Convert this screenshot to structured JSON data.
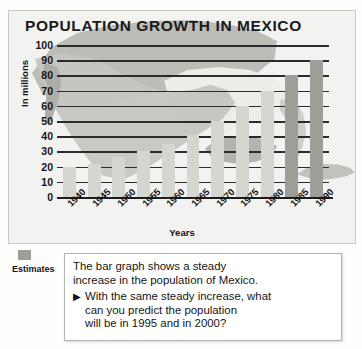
{
  "title": "POPULATION GROWTH IN MEXICO",
  "legend": {
    "label": "Estimates",
    "swatch_color": "#9e9e98"
  },
  "callout": {
    "line1": "The bar graph shows a steady",
    "line2": "increase in the population of Mexico.",
    "arrow": "▶",
    "bullet_line1": "With the same steady increase, what",
    "bullet_line2": "can you predict the population",
    "bullet_line3": "will be in 1995 and in 2000?"
  },
  "colors": {
    "bar": "#d6d6d0",
    "bar_estimate": "#9e9e98",
    "panel_bg": "#f2f2f0",
    "axis": "#1d1d1d",
    "text": "#141414"
  },
  "chart_data": {
    "type": "bar",
    "title": "POPULATION GROWTH IN MEXICO",
    "xlabel": "Years",
    "ylabel": "In millions",
    "ylim": [
      0,
      100
    ],
    "ytick_labels": [
      "100",
      "90",
      "80",
      "70",
      "60",
      "50",
      "40",
      "30",
      "20",
      "10",
      "0"
    ],
    "ytick_values": [
      100,
      90,
      80,
      70,
      60,
      50,
      40,
      30,
      20,
      10,
      0
    ],
    "grid": true,
    "legend_position": "bottom-left",
    "categories": [
      "1940",
      "1945",
      "1950",
      "1955",
      "1960",
      "1965",
      "1970",
      "1975",
      "1980",
      "1985",
      "1990"
    ],
    "values": [
      20,
      22,
      26,
      30,
      35,
      41,
      50,
      60,
      70,
      80,
      90
    ],
    "estimate_flags": [
      false,
      false,
      false,
      false,
      false,
      false,
      false,
      false,
      false,
      true,
      true
    ],
    "series": [
      {
        "name": "Population (millions)",
        "values": [
          20,
          22,
          26,
          30,
          35,
          41,
          50,
          60,
          70,
          80,
          90
        ]
      }
    ]
  }
}
